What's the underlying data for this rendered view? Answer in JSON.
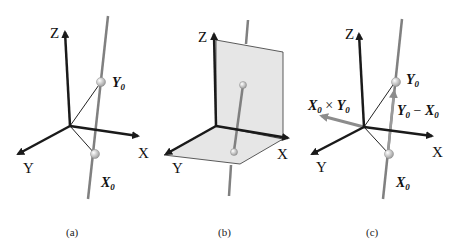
{
  "panels": [
    {
      "caption": "(a)",
      "axes": {
        "x": "X",
        "y": "Y",
        "z": "Z"
      },
      "points": [
        {
          "base": "Y",
          "sub": "0"
        },
        {
          "base": "X",
          "sub": "0"
        }
      ]
    },
    {
      "caption": "(b)",
      "axes": {
        "x": "X",
        "y": "Y",
        "z": "Z"
      }
    },
    {
      "caption": "(c)",
      "axes": {
        "x": "X",
        "y": "Y",
        "z": "Z"
      },
      "points": [
        {
          "base": "Y",
          "sub": "0"
        },
        {
          "base": "X",
          "sub": "0"
        }
      ],
      "vectors": {
        "cross": {
          "a": "X",
          "a_sub": "0",
          "op": " × ",
          "b": "Y",
          "b_sub": "0"
        },
        "diff": {
          "a": "Y",
          "a_sub": "0",
          "op": " − ",
          "b": "X",
          "b_sub": "0"
        }
      }
    }
  ],
  "colors": {
    "axis": "#1a1a1a",
    "line": "#808080",
    "plane": "#e6e6e6",
    "cross_vector": "#8c8c8c"
  }
}
